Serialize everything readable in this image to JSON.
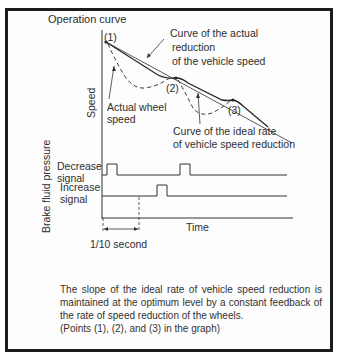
{
  "diagram": {
    "title": "Operation curve",
    "y_axis_upper_label": "Speed",
    "y_axis_lower_label": "Brake fluid pressure",
    "x_axis_label": "Time",
    "points": {
      "p1": "(1)",
      "p2": "(2)",
      "p3": "(3)"
    },
    "annotations": {
      "actual_reduction": [
        "Curve of the actual",
        "reduction",
        "of the vehicle speed"
      ],
      "actual_wheel_speed": [
        "Actual wheel",
        "speed"
      ],
      "ideal_rate": [
        "Curve of the ideal rate",
        "of vehicle speed reduction"
      ]
    },
    "signals": {
      "decrease": [
        "Decrease",
        "signal"
      ],
      "increase": [
        "Increase",
        "signal"
      ]
    },
    "time_interval_label": "1/10 second"
  },
  "caption": {
    "lines": [
      "The slope of the ideal rate of vehicle speed reduction is maintained at the optimum level by a constant feedback of the rate of speed reduction of the wheels.",
      "(Points (1), (2), and (3) in the graph)"
    ]
  },
  "colors": {
    "line": "#333333",
    "frame": "#1c1c1c",
    "background": "#fdfdfd"
  }
}
